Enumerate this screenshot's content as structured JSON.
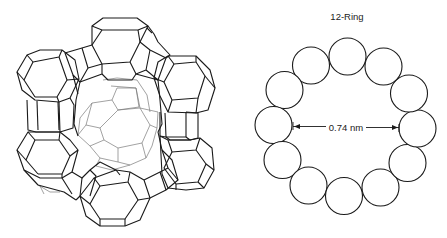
{
  "figure": {
    "left_panel": {
      "subject": "zeolite framework wireframe (faujasite supercage with sodalite cages)",
      "icon": "framework-wireframe"
    },
    "right_panel": {
      "title": "12-Ring",
      "ring_member_count": 12,
      "dimension_label": "0.74 nm"
    },
    "colors": {
      "stroke": "#1a1a1a",
      "inner_stroke": "#7a7a7a",
      "background": "#ffffff"
    }
  }
}
